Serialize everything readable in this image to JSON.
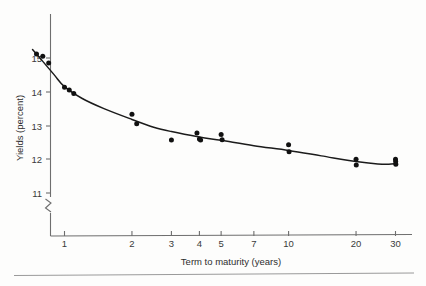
{
  "chart_data": {
    "type": "scatter",
    "title": "",
    "subtitle": "",
    "xlabel": "Term to maturity (years)",
    "ylabel": "Yields (percent)",
    "x_scale": "log",
    "y_scale": "linear",
    "xlim": [
      0.55,
      34
    ],
    "ylim": [
      10.6,
      15.45
    ],
    "y_axis_broken": true,
    "y_break_note": "axis break below 11",
    "grid": false,
    "legend": null,
    "xticks": [
      1,
      2,
      3,
      4,
      5,
      7,
      10,
      20,
      30
    ],
    "xtick_labels": [
      "1",
      "2",
      "3",
      "4",
      "5",
      "7",
      "10",
      "20",
      "30"
    ],
    "yticks": [
      11,
      12,
      13,
      14,
      15
    ],
    "ytick_labels": [
      "11",
      "12",
      "13",
      "14",
      "15"
    ],
    "points": [
      {
        "x": 0.75,
        "y": 15.12
      },
      {
        "x": 0.8,
        "y": 15.05
      },
      {
        "x": 0.85,
        "y": 14.85
      },
      {
        "x": 1.0,
        "y": 14.13
      },
      {
        "x": 1.05,
        "y": 14.05
      },
      {
        "x": 1.1,
        "y": 13.95
      },
      {
        "x": 2.0,
        "y": 13.33
      },
      {
        "x": 2.1,
        "y": 13.05
      },
      {
        "x": 3.0,
        "y": 12.57
      },
      {
        "x": 3.9,
        "y": 12.78
      },
      {
        "x": 4.0,
        "y": 12.6
      },
      {
        "x": 4.05,
        "y": 12.57
      },
      {
        "x": 5.0,
        "y": 12.73
      },
      {
        "x": 5.05,
        "y": 12.58
      },
      {
        "x": 10.0,
        "y": 12.43
      },
      {
        "x": 10.05,
        "y": 12.22
      },
      {
        "x": 20.0,
        "y": 12.0
      },
      {
        "x": 20.05,
        "y": 11.83
      },
      {
        "x": 30.0,
        "y": 12.0
      },
      {
        "x": 30.05,
        "y": 11.93
      },
      {
        "x": 30.1,
        "y": 11.85
      }
    ],
    "fit_curve": [
      {
        "x": 0.72,
        "y": 15.25
      },
      {
        "x": 0.8,
        "y": 14.9
      },
      {
        "x": 0.9,
        "y": 14.5
      },
      {
        "x": 1.0,
        "y": 14.15
      },
      {
        "x": 1.2,
        "y": 13.8
      },
      {
        "x": 1.5,
        "y": 13.5
      },
      {
        "x": 2.0,
        "y": 13.18
      },
      {
        "x": 2.5,
        "y": 12.95
      },
      {
        "x": 3.0,
        "y": 12.82
      },
      {
        "x": 4.0,
        "y": 12.66
      },
      {
        "x": 5.0,
        "y": 12.56
      },
      {
        "x": 7.0,
        "y": 12.4
      },
      {
        "x": 10.0,
        "y": 12.26
      },
      {
        "x": 14.0,
        "y": 12.1
      },
      {
        "x": 20.0,
        "y": 11.93
      },
      {
        "x": 25.0,
        "y": 11.86
      },
      {
        "x": 28.0,
        "y": 11.85
      },
      {
        "x": 30.0,
        "y": 11.87
      }
    ]
  },
  "colors": {
    "point": "#111111",
    "curve": "#1b1b1b",
    "axis": "#6e6e6e",
    "text": "#2e2e2e",
    "background": "#fdfdfc"
  }
}
